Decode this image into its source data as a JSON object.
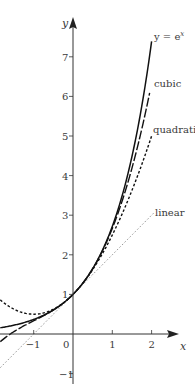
{
  "chart_data": {
    "type": "line",
    "title": "",
    "xlabel": "x",
    "ylabel": "y",
    "xlim": [
      -1.85,
      2.3
    ],
    "ylim": [
      -1.25,
      7.9
    ],
    "grid": false,
    "legend": "inline labels at right end of curves",
    "x_ticks": [
      -1,
      0,
      1,
      2
    ],
    "x_tick_labels": [
      "−1",
      "0",
      "1",
      "2"
    ],
    "y_ticks": [
      -1,
      1,
      2,
      3,
      4,
      5,
      6,
      7
    ],
    "y_tick_labels": [
      "−1",
      "1",
      "2",
      "3",
      "4",
      "5",
      "6",
      "7"
    ],
    "series": [
      {
        "name": "y = e^x",
        "label": "y = e",
        "label_sup": "x",
        "formula": "exp",
        "x_range": [
          -1.85,
          2.0
        ],
        "style": "solid",
        "color": "#111111",
        "sample_points": [
          [
            -1.8,
            0.17
          ],
          [
            -1,
            0.37
          ],
          [
            0,
            1
          ],
          [
            1,
            2.72
          ],
          [
            2,
            7.39
          ]
        ]
      },
      {
        "name": "cubic",
        "label": "cubic",
        "formula": "1 + x + x^2/2 + x^3/6",
        "coefficients": [
          1,
          1,
          0.5,
          0.1667
        ],
        "x_range": [
          -1.85,
          1.95
        ],
        "style": "long-dash",
        "color": "#111111",
        "sample_points": [
          [
            -1.5,
            0.06
          ],
          [
            -1,
            0.33
          ],
          [
            0,
            1
          ],
          [
            1,
            2.67
          ],
          [
            1.95,
            6.08
          ]
        ]
      },
      {
        "name": "quadratic",
        "label": "quadratic",
        "formula": "1 + x + x^2/2",
        "coefficients": [
          1,
          1,
          0.5
        ],
        "x_range": [
          -1.85,
          2.0
        ],
        "style": "short-dash",
        "color": "#111111",
        "sample_points": [
          [
            -1.8,
            0.82
          ],
          [
            -1,
            0.5
          ],
          [
            0,
            1
          ],
          [
            1,
            2.5
          ],
          [
            2,
            5
          ]
        ]
      },
      {
        "name": "linear",
        "label": "linear",
        "formula": "1 + x",
        "coefficients": [
          1,
          1
        ],
        "x_range": [
          -1.85,
          2.05
        ],
        "style": "dotted",
        "color": "#777777",
        "sample_points": [
          [
            -1.85,
            -0.85
          ],
          [
            -1,
            0
          ],
          [
            0,
            1
          ],
          [
            1,
            2
          ],
          [
            2,
            3
          ]
        ]
      }
    ],
    "annotations": [
      {
        "text": "y = e^x",
        "x": 2.05,
        "y": 7.45
      },
      {
        "text": "cubic",
        "x": 2.05,
        "y": 6.2
      },
      {
        "text": "quadratic",
        "x": 2.05,
        "y": 4.9
      },
      {
        "text": "linear",
        "x": 2.05,
        "y": 3.0
      }
    ]
  }
}
